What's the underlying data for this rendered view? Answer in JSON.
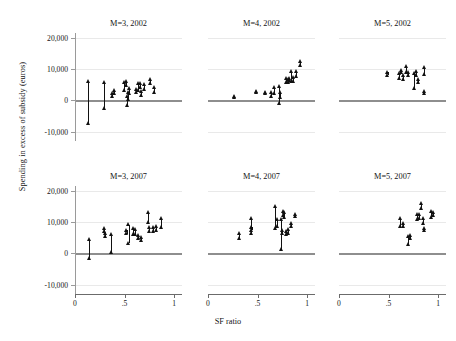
{
  "chart_data": {
    "type": "scatter",
    "title": "",
    "xlabel": "SF ratio",
    "ylabel": "Spending in excess of subsidy (euros)",
    "xlim": [
      0,
      1.08
    ],
    "ylim": [
      -13000,
      21500
    ],
    "xticks": [
      0,
      0.5,
      1
    ],
    "xticklabels": [
      "0",
      ".5",
      "1"
    ],
    "yticks": [
      20000,
      10000,
      0,
      -10000
    ],
    "yticklabels": [
      "20,000",
      "10,000",
      "0",
      "-10,000"
    ],
    "grid": "horizontal",
    "legend": "none",
    "marker": "triangle-up",
    "marker_color": "#111111",
    "zero_line_color": "#8e8e8e",
    "grid_color": "#e9e9e9",
    "layout": {
      "rows": 2,
      "cols": 3
    },
    "panels": [
      {
        "title": "M=3, 2002",
        "row": 0,
        "col": 0,
        "points": [
          {
            "x": 0.135,
            "low": -7300,
            "high": 6000
          },
          {
            "x": 0.295,
            "low": -2500,
            "high": 5700
          },
          {
            "x": 0.375,
            "low": 1200,
            "high": 2400
          },
          {
            "x": 0.395,
            "low": 2300,
            "high": 3400
          },
          {
            "x": 0.495,
            "low": 3400,
            "high": 5900
          },
          {
            "x": 0.515,
            "low": 4800,
            "high": 6000
          },
          {
            "x": 0.525,
            "low": -1400,
            "high": 1400
          },
          {
            "x": 0.535,
            "low": 300,
            "high": 2600
          },
          {
            "x": 0.545,
            "low": 2400,
            "high": 4000
          },
          {
            "x": 0.615,
            "low": 2600,
            "high": 3500
          },
          {
            "x": 0.635,
            "low": 3200,
            "high": 5400
          },
          {
            "x": 0.655,
            "low": 4200,
            "high": 5500
          },
          {
            "x": 0.665,
            "low": 1800,
            "high": 3000
          },
          {
            "x": 0.695,
            "low": 3500,
            "high": 5100
          },
          {
            "x": 0.755,
            "low": 5600,
            "high": 6700
          },
          {
            "x": 0.795,
            "low": 2700,
            "high": 4100
          }
        ]
      },
      {
        "title": "M=4, 2002",
        "row": 0,
        "col": 1,
        "points": [
          {
            "x": 0.26,
            "low": 900,
            "high": 1400
          },
          {
            "x": 0.49,
            "low": 2500,
            "high": 2900
          },
          {
            "x": 0.575,
            "low": 2300,
            "high": 2700
          },
          {
            "x": 0.64,
            "low": 1500,
            "high": 2600
          },
          {
            "x": 0.665,
            "low": 2400,
            "high": 4100
          },
          {
            "x": 0.715,
            "low": -900,
            "high": 4600
          },
          {
            "x": 0.725,
            "low": 1000,
            "high": 2600
          },
          {
            "x": 0.79,
            "low": 5800,
            "high": 7100
          },
          {
            "x": 0.805,
            "low": 5700,
            "high": 6900
          },
          {
            "x": 0.82,
            "low": 6300,
            "high": 7200
          },
          {
            "x": 0.835,
            "low": 6000,
            "high": 9300
          },
          {
            "x": 0.86,
            "low": 6000,
            "high": 7300
          },
          {
            "x": 0.885,
            "low": 7600,
            "high": 9200
          },
          {
            "x": 0.925,
            "low": 11200,
            "high": 12600
          }
        ]
      },
      {
        "title": "M=5, 2002",
        "row": 0,
        "col": 2,
        "points": [
          {
            "x": 0.49,
            "low": 8200,
            "high": 9100
          },
          {
            "x": 0.61,
            "low": 7100,
            "high": 8600
          },
          {
            "x": 0.625,
            "low": 8900,
            "high": 9800
          },
          {
            "x": 0.645,
            "low": 6800,
            "high": 8200
          },
          {
            "x": 0.68,
            "low": 9000,
            "high": 10900
          },
          {
            "x": 0.7,
            "low": 7900,
            "high": 9000
          },
          {
            "x": 0.755,
            "low": 3900,
            "high": 8600
          },
          {
            "x": 0.775,
            "low": 8200,
            "high": 9400
          },
          {
            "x": 0.8,
            "low": 5900,
            "high": 6900
          },
          {
            "x": 0.855,
            "low": 8500,
            "high": 10600
          },
          {
            "x": 0.86,
            "low": 2200,
            "high": 3100
          }
        ]
      },
      {
        "title": "M=3, 2007",
        "row": 1,
        "col": 0,
        "points": [
          {
            "x": 0.14,
            "low": -1400,
            "high": 4500
          },
          {
            "x": 0.295,
            "low": 7000,
            "high": 8100
          },
          {
            "x": 0.3,
            "low": 5400,
            "high": 6500
          },
          {
            "x": 0.36,
            "low": 500,
            "high": 6100
          },
          {
            "x": 0.52,
            "low": 6300,
            "high": 7400
          },
          {
            "x": 0.54,
            "low": 3300,
            "high": 9200
          },
          {
            "x": 0.59,
            "low": 6100,
            "high": 7900
          },
          {
            "x": 0.61,
            "low": 6000,
            "high": 7600
          },
          {
            "x": 0.64,
            "low": 4800,
            "high": 5700
          },
          {
            "x": 0.665,
            "low": 4100,
            "high": 5200
          },
          {
            "x": 0.735,
            "low": 10000,
            "high": 13200
          },
          {
            "x": 0.745,
            "low": 7100,
            "high": 8400
          },
          {
            "x": 0.79,
            "low": 7000,
            "high": 8300
          },
          {
            "x": 0.815,
            "low": 7400,
            "high": 8600
          },
          {
            "x": 0.87,
            "low": 8300,
            "high": 11100
          }
        ]
      },
      {
        "title": "M=4, 2007",
        "row": 1,
        "col": 1,
        "points": [
          {
            "x": 0.31,
            "low": 4700,
            "high": 6300
          },
          {
            "x": 0.43,
            "low": 6500,
            "high": 11300
          },
          {
            "x": 0.44,
            "low": 7300,
            "high": 8300
          },
          {
            "x": 0.68,
            "low": 8200,
            "high": 15100
          },
          {
            "x": 0.7,
            "low": 8700,
            "high": 10900
          },
          {
            "x": 0.735,
            "low": 1500,
            "high": 11000
          },
          {
            "x": 0.75,
            "low": 6400,
            "high": 7400
          },
          {
            "x": 0.76,
            "low": 12200,
            "high": 13500
          },
          {
            "x": 0.77,
            "low": 11600,
            "high": 13100
          },
          {
            "x": 0.785,
            "low": 6200,
            "high": 7200
          },
          {
            "x": 0.805,
            "low": 6400,
            "high": 7600
          },
          {
            "x": 0.84,
            "low": 8600,
            "high": 9600
          },
          {
            "x": 0.88,
            "low": 11800,
            "high": 12600
          }
        ]
      },
      {
        "title": "M=5, 2007",
        "row": 1,
        "col": 2,
        "points": [
          {
            "x": 0.62,
            "low": 8700,
            "high": 11100
          },
          {
            "x": 0.645,
            "low": 8600,
            "high": 9500
          },
          {
            "x": 0.7,
            "low": 3100,
            "high": 5400
          },
          {
            "x": 0.72,
            "low": 5000,
            "high": 5900
          },
          {
            "x": 0.79,
            "low": 10800,
            "high": 12400
          },
          {
            "x": 0.805,
            "low": 11400,
            "high": 12500
          },
          {
            "x": 0.83,
            "low": 14400,
            "high": 16100
          },
          {
            "x": 0.845,
            "low": 9800,
            "high": 11100
          },
          {
            "x": 0.86,
            "low": 7300,
            "high": 8200
          },
          {
            "x": 0.93,
            "low": 11600,
            "high": 13400
          },
          {
            "x": 0.945,
            "low": 12200,
            "high": 13100
          }
        ]
      }
    ]
  }
}
